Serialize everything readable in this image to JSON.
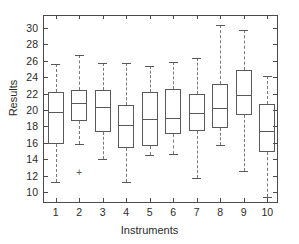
{
  "chart_data": {
    "type": "box",
    "title": "",
    "xlabel": "Instruments",
    "ylabel": "Results",
    "categories": [
      "1",
      "2",
      "3",
      "4",
      "5",
      "6",
      "7",
      "8",
      "9",
      "10"
    ],
    "ylim": [
      8.6,
      31.4
    ],
    "yticks": [
      10,
      12,
      14,
      16,
      18,
      20,
      22,
      24,
      26,
      28,
      30
    ],
    "ytick_labels": [
      "10",
      "12",
      "14",
      "16",
      "18",
      "20",
      "22",
      "24",
      "26",
      "28",
      "30"
    ],
    "grid": false,
    "legend": null,
    "boxes": [
      {
        "label": "1",
        "whisker_low": 11.3,
        "q1": 15.9,
        "median": 19.7,
        "q3": 22.2,
        "whisker_high": 25.6,
        "outliers": []
      },
      {
        "label": "2",
        "whisker_low": 15.9,
        "q1": 18.7,
        "median": 20.8,
        "q3": 22.4,
        "whisker_high": 26.7,
        "outliers": [
          12.4
        ]
      },
      {
        "label": "3",
        "whisker_low": 14.1,
        "q1": 17.3,
        "median": 20.4,
        "q3": 22.4,
        "whisker_high": 25.7,
        "outliers": []
      },
      {
        "label": "4",
        "whisker_low": 11.3,
        "q1": 15.4,
        "median": 18.2,
        "q3": 20.6,
        "whisker_high": 25.7,
        "outliers": []
      },
      {
        "label": "5",
        "whisker_low": 14.6,
        "q1": 15.6,
        "median": 18.9,
        "q3": 22.2,
        "whisker_high": 25.3,
        "outliers": []
      },
      {
        "label": "6",
        "whisker_low": 14.7,
        "q1": 17.1,
        "median": 19.0,
        "q3": 22.6,
        "whisker_high": 25.8,
        "outliers": []
      },
      {
        "label": "7",
        "whisker_low": 11.8,
        "q1": 17.5,
        "median": 19.6,
        "q3": 22.0,
        "whisker_high": 26.3,
        "outliers": []
      },
      {
        "label": "8",
        "whisker_low": 15.7,
        "q1": 17.8,
        "median": 20.3,
        "q3": 23.2,
        "whisker_high": 30.3,
        "outliers": []
      },
      {
        "label": "9",
        "whisker_low": 12.6,
        "q1": 19.4,
        "median": 21.8,
        "q3": 24.8,
        "whisker_high": 29.7,
        "outliers": []
      },
      {
        "label": "10",
        "whisker_low": 9.5,
        "q1": 14.9,
        "median": 17.4,
        "q3": 20.7,
        "whisker_high": 24.1,
        "outliers": []
      }
    ]
  },
  "colors": {
    "box_edge": "#595959",
    "whisker": "#7a7a7a",
    "axis": "#4a4a4a",
    "text": "#2b2b2b",
    "background": "#ffffff"
  }
}
